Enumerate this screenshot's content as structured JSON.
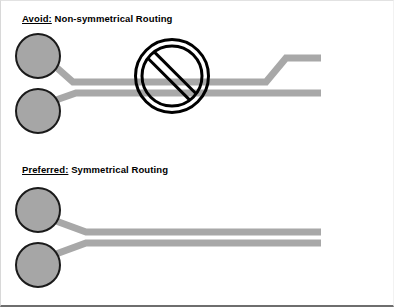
{
  "figure": {
    "background_color": "#ffffff",
    "width": 394,
    "height": 307
  },
  "colors": {
    "trace": "#a8a8a8",
    "pad_fill": "#a6a6a6",
    "pad_stroke": "#1a1a1a",
    "prohibition_sign": "#000000",
    "text": "#000000",
    "frame": "#6e6e6e"
  },
  "sections": [
    {
      "id": "avoid",
      "keyword": "Avoid:",
      "caption_rest": " Non-symmetrical Routing",
      "caption_full": "Avoid: Non-symmetrical Routing",
      "has_prohibition_sign": true,
      "pads": [
        {
          "name": "pad-top",
          "cx": 37,
          "cy": 55,
          "r": 22
        },
        {
          "name": "pad-bottom",
          "cx": 37,
          "cy": 110,
          "r": 22
        }
      ],
      "traces": [
        {
          "name": "trace-upper-nonsymmetrical",
          "points": "55,66 72,81 265,81 285,57 320,57"
        },
        {
          "name": "trace-lower-nonsymmetrical",
          "points": "55,99 75,92 320,92"
        }
      ],
      "prohibition_sign": {
        "cx": 171,
        "cy": 75,
        "outer_r": 38,
        "inner_r": 30,
        "slash_width": 9
      }
    },
    {
      "id": "preferred",
      "keyword": "Preferred:",
      "caption_rest": " Symmetrical Routing",
      "caption_full": "Preferred: Symmetrical Routing",
      "has_prohibition_sign": false,
      "pads": [
        {
          "name": "pad-top",
          "cx": 37,
          "cy": 209,
          "r": 22
        },
        {
          "name": "pad-bottom",
          "cx": 37,
          "cy": 264,
          "r": 22
        }
      ],
      "traces": [
        {
          "name": "trace-upper-symmetrical",
          "points": "55,220 85,231 320,231"
        },
        {
          "name": "trace-lower-symmetrical",
          "points": "55,253 85,242 320,242"
        }
      ]
    }
  ],
  "trace_width": 7
}
